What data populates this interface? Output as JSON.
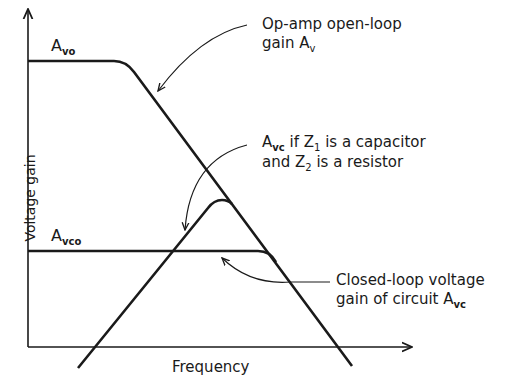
{
  "diagram": {
    "axes": {
      "ylabel": "Voltage gain",
      "xlabel": "Frequency"
    },
    "levels": {
      "avo": {
        "symbol": "A",
        "sub": "vo"
      },
      "avco": {
        "symbol": "A",
        "sub": "vco"
      }
    },
    "annotations": {
      "open_loop": {
        "line1": "Op-amp open-loop",
        "line2_prefix": "gain ",
        "symbol": "A",
        "sub": "v"
      },
      "capacitor": {
        "symbol": "A",
        "sub": "vc",
        "line1_rest": " if Z",
        "z1_sub": "1",
        "line1_end": " is a capacitor",
        "line2_start": "and Z",
        "z2_sub": "2",
        "line2_end": " is a resistor"
      },
      "closed_loop": {
        "line1": "Closed-loop voltage",
        "line2_prefix": "gain of circuit ",
        "symbol": "A",
        "sub": "vc"
      }
    },
    "colors": {
      "ink": "#1a1a1a",
      "background": "#ffffff"
    }
  }
}
